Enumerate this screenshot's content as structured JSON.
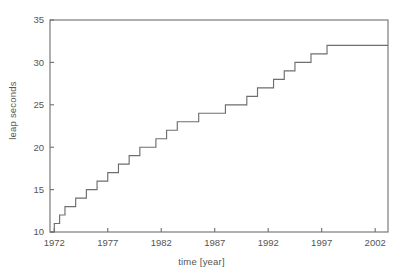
{
  "chart_data": {
    "type": "line",
    "subtype": "step",
    "title": "",
    "xlabel": "time [year]",
    "ylabel": "leap seconds",
    "xlim": [
      1971.6,
      2003.2
    ],
    "ylim": [
      10,
      35
    ],
    "xticks": [
      1972,
      1977,
      1982,
      1987,
      1992,
      1997,
      2002
    ],
    "yticks": [
      10,
      15,
      20,
      25,
      30,
      35
    ],
    "grid": false,
    "legend": null,
    "line_color": "#6e6e6e",
    "frame_color": "#6e6e6e",
    "background": "#ffffff",
    "step_mode": "post",
    "x": [
      1971.6,
      1972.0,
      1972.5,
      1973.0,
      1974.0,
      1975.0,
      1976.0,
      1977.0,
      1978.0,
      1979.0,
      1980.0,
      1981.5,
      1982.5,
      1983.5,
      1985.5,
      1988.0,
      1990.0,
      1991.0,
      1992.5,
      1993.5,
      1994.5,
      1996.0,
      1997.5,
      1999.0,
      2003.2
    ],
    "y": [
      10,
      11,
      12,
      13,
      14,
      15,
      16,
      17,
      18,
      19,
      20,
      21,
      22,
      23,
      24,
      25,
      26,
      27,
      28,
      29,
      30,
      31,
      32,
      32,
      32
    ],
    "series": [
      {
        "name": "TAI-UTC",
        "points": [
          {
            "x": 1971.6,
            "y": 10
          },
          {
            "x": 1972.0,
            "y": 11
          },
          {
            "x": 1972.5,
            "y": 12
          },
          {
            "x": 1973.0,
            "y": 13
          },
          {
            "x": 1974.0,
            "y": 14
          },
          {
            "x": 1975.0,
            "y": 15
          },
          {
            "x": 1976.0,
            "y": 16
          },
          {
            "x": 1977.0,
            "y": 17
          },
          {
            "x": 1978.0,
            "y": 18
          },
          {
            "x": 1979.0,
            "y": 19
          },
          {
            "x": 1980.0,
            "y": 20
          },
          {
            "x": 1981.5,
            "y": 21
          },
          {
            "x": 1982.5,
            "y": 22
          },
          {
            "x": 1983.5,
            "y": 23
          },
          {
            "x": 1985.5,
            "y": 24
          },
          {
            "x": 1988.0,
            "y": 25
          },
          {
            "x": 1990.0,
            "y": 26
          },
          {
            "x": 1991.0,
            "y": 27
          },
          {
            "x": 1992.5,
            "y": 28
          },
          {
            "x": 1993.5,
            "y": 29
          },
          {
            "x": 1994.5,
            "y": 30
          },
          {
            "x": 1996.0,
            "y": 31
          },
          {
            "x": 1997.5,
            "y": 32
          },
          {
            "x": 2003.2,
            "y": 32
          }
        ]
      }
    ]
  }
}
